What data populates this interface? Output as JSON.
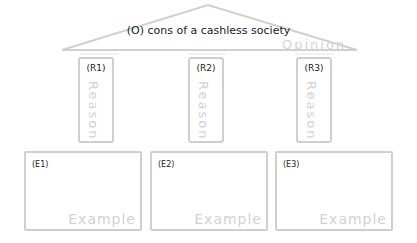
{
  "opinion": {
    "label": "(O)  cons of a cashless society",
    "watermark": "Opinion"
  },
  "reasons": [
    {
      "label": "(R1)",
      "watermark": "Reason"
    },
    {
      "label": "(R2)",
      "watermark": "Reason"
    },
    {
      "label": "(R3)",
      "watermark": "Reason"
    }
  ],
  "examples": [
    {
      "label": "(E1)",
      "watermark": "Example"
    },
    {
      "label": "(E2)",
      "watermark": "Example"
    },
    {
      "label": "(E3)",
      "watermark": "Example"
    }
  ],
  "colors": {
    "outline": "#cfcfcf",
    "text": "#222222",
    "watermark": "#d2d2d2"
  }
}
